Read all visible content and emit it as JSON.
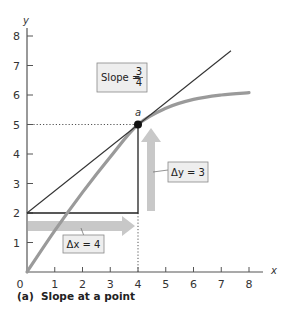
{
  "chart_data": {
    "type": "line",
    "title": "",
    "caption": "(a)  Slope at a point",
    "xlabel": "x",
    "ylabel": "y",
    "xlim": [
      0,
      8
    ],
    "ylim": [
      0,
      8
    ],
    "x_ticks": [
      0,
      1,
      2,
      3,
      4,
      5,
      6,
      7,
      8
    ],
    "y_ticks": [
      1,
      2,
      3,
      4,
      5,
      6,
      7,
      8
    ],
    "grid": false,
    "series": [
      {
        "name": "curve",
        "color": "#9a9a9a",
        "x": [
          0,
          1,
          2,
          3,
          4,
          5,
          6,
          7,
          8
        ],
        "y": [
          0,
          1.4,
          2.7,
          3.9,
          5.0,
          5.55,
          5.85,
          6.0,
          6.08
        ]
      },
      {
        "name": "tangent line",
        "color": "#333333",
        "x": [
          0,
          7.35
        ],
        "y": [
          2,
          7.5
        ]
      }
    ],
    "point": {
      "label": "a",
      "x": 4,
      "y": 5
    },
    "triangle": {
      "from": [
        0,
        2
      ],
      "corner": [
        4,
        2
      ],
      "to": [
        4,
        5
      ]
    },
    "annotations": [
      {
        "id": "slope",
        "text_prefix": "Slope = ",
        "numerator": "3",
        "denominator": "4"
      },
      {
        "id": "delta_y",
        "text": "Δy = 3",
        "value": 3
      },
      {
        "id": "delta_x",
        "text": "Δx = 4",
        "value": 4
      }
    ],
    "colors": {
      "axis": "#555555",
      "curve": "#9a9a9a",
      "arrow": "#c8c8c8",
      "box_fill": "#eeeeee",
      "box_stroke": "#888888",
      "tangent": "#333333"
    }
  }
}
